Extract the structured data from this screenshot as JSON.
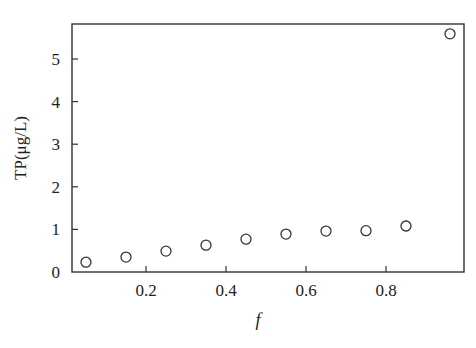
{
  "chart_data": {
    "type": "scatter",
    "title": "",
    "xlabel": "f",
    "ylabel": "TP(μg/L)",
    "xlim": [
      0,
      0.99
    ],
    "ylim": [
      0,
      5.9
    ],
    "xticks": [
      0.2,
      0.4,
      0.6,
      0.8
    ],
    "xtick_labels": [
      "0.2",
      "0.4",
      "0.6",
      "0.8"
    ],
    "yticks": [
      0,
      1,
      2,
      3,
      4,
      5
    ],
    "ytick_labels": [
      "0",
      "1",
      "2",
      "3",
      "4",
      "5"
    ],
    "grid": false,
    "legend": null,
    "marker": "open-circle",
    "series": [
      {
        "name": "TP",
        "x": [
          0.05,
          0.15,
          0.25,
          0.35,
          0.45,
          0.55,
          0.65,
          0.75,
          0.85,
          0.96
        ],
        "y": [
          0.23,
          0.35,
          0.49,
          0.63,
          0.77,
          0.89,
          0.96,
          0.97,
          1.08,
          5.59
        ]
      }
    ]
  }
}
